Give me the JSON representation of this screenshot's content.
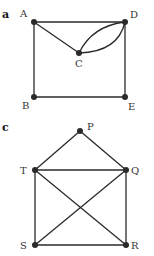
{
  "graphs": [
    {
      "part_label": "a",
      "vertices": [
        {
          "id": "A",
          "label": "A",
          "x": 34,
          "y": 22
        },
        {
          "id": "D",
          "label": "D",
          "x": 125,
          "y": 22
        },
        {
          "id": "C",
          "label": "C",
          "x": 79,
          "y": 53
        },
        {
          "id": "B",
          "label": "B",
          "x": 34,
          "y": 97
        },
        {
          "id": "E",
          "label": "E",
          "x": 125,
          "y": 97
        }
      ],
      "edges": [
        {
          "from": "A",
          "to": "D",
          "type": "straight"
        },
        {
          "from": "A",
          "to": "C",
          "type": "straight"
        },
        {
          "from": "C",
          "to": "D",
          "type": "curve-upper"
        },
        {
          "from": "C",
          "to": "D",
          "type": "curve-lower"
        },
        {
          "from": "A",
          "to": "B",
          "type": "straight"
        },
        {
          "from": "D",
          "to": "E",
          "type": "straight"
        },
        {
          "from": "B",
          "to": "E",
          "type": "straight"
        }
      ]
    },
    {
      "part_label": "c",
      "vertices": [
        {
          "id": "P",
          "label": "P",
          "x": 80,
          "y": 131
        },
        {
          "id": "T",
          "label": "T",
          "x": 35,
          "y": 170
        },
        {
          "id": "Q",
          "label": "Q",
          "x": 126,
          "y": 170
        },
        {
          "id": "S",
          "label": "S",
          "x": 35,
          "y": 245
        },
        {
          "id": "R",
          "label": "R",
          "x": 126,
          "y": 245
        }
      ],
      "edges": [
        {
          "from": "P",
          "to": "T"
        },
        {
          "from": "P",
          "to": "Q"
        },
        {
          "from": "T",
          "to": "Q"
        },
        {
          "from": "T",
          "to": "S"
        },
        {
          "from": "Q",
          "to": "R"
        },
        {
          "from": "S",
          "to": "R"
        },
        {
          "from": "T",
          "to": "R"
        },
        {
          "from": "S",
          "to": "Q"
        }
      ]
    }
  ]
}
